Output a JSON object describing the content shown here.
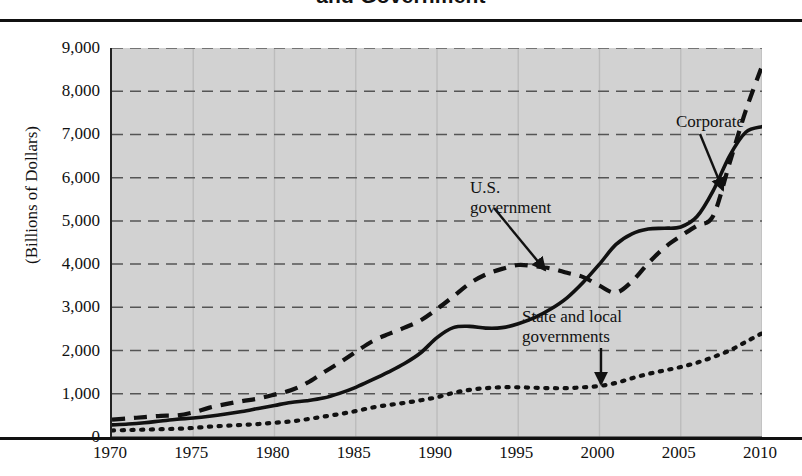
{
  "title": "and Government",
  "y_axis_title": "(Billions of Dollars)",
  "y_ticks": [
    "9,000",
    "8,000",
    "7,000",
    "6,000",
    "5,000",
    "4,000",
    "3,000",
    "2,000",
    "1,000",
    "0"
  ],
  "x_ticks": [
    "1970",
    "1975",
    "1980",
    "1985",
    "1990",
    "1995",
    "2000",
    "2005",
    "2010"
  ],
  "annotations": {
    "corporate": "Corporate",
    "us_government_line1": "U.S.",
    "us_government_line2": "government",
    "state_local_line1": "State and local",
    "state_local_line2": "governments"
  },
  "colors": {
    "plot_background": "#d2d2d2",
    "gridline": "#555555",
    "series_line": "#111111",
    "axis": "#111111",
    "page_background": "#ffffff"
  },
  "chart_data": {
    "type": "line",
    "title": "and Government",
    "xlabel": "",
    "ylabel": "(Billions of Dollars)",
    "xlim": [
      1970,
      2010
    ],
    "ylim": [
      0,
      9000
    ],
    "ytick_step": 1000,
    "grid": true,
    "legend": "inline-annotations",
    "x": [
      1970,
      1971,
      1972,
      1973,
      1974,
      1975,
      1976,
      1977,
      1978,
      1979,
      1980,
      1981,
      1982,
      1983,
      1984,
      1985,
      1986,
      1987,
      1988,
      1989,
      1990,
      1991,
      1992,
      1993,
      1994,
      1995,
      1996,
      1997,
      1998,
      1999,
      2000,
      2001,
      2002,
      2003,
      2004,
      2005,
      2006,
      2007,
      2008,
      2009,
      2010
    ],
    "series": [
      {
        "name": "Corporate",
        "style": "solid",
        "values": [
          280,
          300,
          330,
          370,
          410,
          440,
          480,
          530,
          590,
          660,
          730,
          800,
          840,
          900,
          1010,
          1150,
          1320,
          1500,
          1700,
          1950,
          2300,
          2530,
          2560,
          2520,
          2530,
          2620,
          2760,
          2960,
          3220,
          3580,
          4000,
          4450,
          4700,
          4810,
          4830,
          4860,
          5100,
          5700,
          6500,
          7050,
          7180
        ]
      },
      {
        "name": "U.S. government",
        "style": "dashed",
        "values": [
          400,
          430,
          460,
          490,
          500,
          570,
          680,
          760,
          830,
          890,
          980,
          1080,
          1250,
          1490,
          1720,
          1970,
          2210,
          2380,
          2530,
          2700,
          2960,
          3250,
          3550,
          3760,
          3890,
          3980,
          3950,
          3900,
          3800,
          3700,
          3500,
          3340,
          3600,
          4020,
          4380,
          4650,
          4890,
          5120,
          6330,
          7550,
          8580
        ]
      },
      {
        "name": "State and local governments",
        "style": "dotted",
        "values": [
          150,
          160,
          170,
          180,
          190,
          210,
          240,
          260,
          280,
          300,
          330,
          360,
          410,
          470,
          530,
          600,
          680,
          740,
          790,
          850,
          920,
          1020,
          1090,
          1130,
          1150,
          1150,
          1140,
          1130,
          1130,
          1150,
          1180,
          1250,
          1360,
          1460,
          1540,
          1620,
          1720,
          1850,
          2000,
          2200,
          2400
        ]
      }
    ]
  }
}
